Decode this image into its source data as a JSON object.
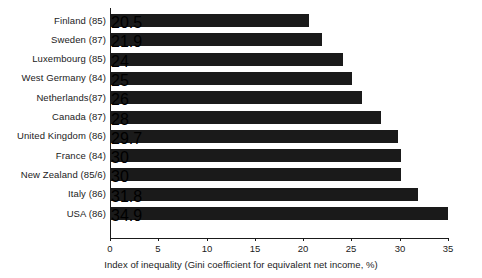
{
  "chart_data": {
    "type": "bar",
    "orientation": "horizontal",
    "title": "",
    "xlabel": "Index of inequality (Gini coefficient for equivalent net income, %)",
    "ylabel": "",
    "xlim": [
      0,
      35
    ],
    "xticks": [
      0,
      5,
      10,
      15,
      20,
      25,
      30,
      35
    ],
    "xtick_labels": [
      "0",
      "5",
      "10",
      "15",
      "20",
      "25",
      "30",
      "35"
    ],
    "grid": false,
    "legend": null,
    "bar_color": "#1a1a1a",
    "background_color": "#ffffff",
    "categories": [
      "Finland (85)",
      "Sweden (87)",
      "Luxembourg (85)",
      "West Germany (84)",
      "Netherlands(87)",
      "Canada (87)",
      "United Kingdom (86)",
      "France (84)",
      "New Zealand (85/6)",
      "Italy (86)",
      "USA (86)"
    ],
    "values": [
      20.5,
      21.9,
      24.0,
      25.0,
      26.0,
      28.0,
      29.7,
      30.0,
      30.0,
      31.8,
      34.9
    ]
  }
}
